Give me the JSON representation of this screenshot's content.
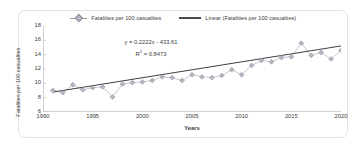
{
  "legend": {
    "position": "top-center",
    "entries": [
      {
        "label": "Fatalities per 100 casualties",
        "type": "marker-line",
        "color": "#b6b6c4"
      },
      {
        "label": "Linear (Fatalities per 100 casualties)",
        "type": "line",
        "color": "#4a4a4a"
      }
    ]
  },
  "annotation": {
    "equation": "y = 0.2222x - 433.61",
    "r_squared_label": "R",
    "r_squared_sup": "2",
    "r_squared_value": " = 0.8473"
  },
  "axes": {
    "xlabel": "Years",
    "ylabel": "Fatalities per 100 casualties",
    "yticks": [
      "18",
      "16",
      "14",
      "12",
      "10",
      "8",
      "6"
    ],
    "xticks": [
      "1990",
      "1995",
      "2000",
      "2005",
      "2010",
      "2015",
      "2020"
    ]
  },
  "chart_data": {
    "type": "scatter",
    "title": "",
    "xlabel": "Years",
    "ylabel": "Fatalities per 100 casualties",
    "xlim": [
      1990,
      2020
    ],
    "ylim": [
      6,
      18
    ],
    "grid": false,
    "legend_position": "top-center",
    "x": [
      1991,
      1992,
      1993,
      1994,
      1995,
      1996,
      1997,
      1998,
      1999,
      2000,
      2001,
      2002,
      2003,
      2004,
      2005,
      2006,
      2007,
      2008,
      2009,
      2010,
      2011,
      2012,
      2013,
      2014,
      2015,
      2016,
      2017,
      2018,
      2019,
      2020
    ],
    "series": [
      {
        "name": "Fatalities per 100 casualties",
        "marker": "diamond",
        "color": "#b6b6c4",
        "values": [
          9.0,
          8.7,
          9.8,
          9.1,
          9.4,
          9.5,
          8.1,
          9.9,
          10.1,
          10.2,
          10.4,
          10.9,
          10.8,
          10.4,
          11.2,
          10.9,
          10.8,
          11.1,
          11.9,
          11.2,
          12.5,
          13.2,
          13.0,
          13.6,
          13.7,
          15.6,
          13.9,
          14.3,
          13.4,
          14.6
        ]
      },
      {
        "name": "Linear (Fatalities per 100 casualties)",
        "type": "trendline",
        "color": "#4a4a4a",
        "equation": "y = 0.2222x - 433.61",
        "slope": 0.2222,
        "intercept": -433.61,
        "r_squared": 0.8473,
        "endpoints": [
          {
            "x": 1991,
            "y": 8.78
          },
          {
            "x": 2020,
            "y": 15.22
          }
        ]
      }
    ]
  }
}
